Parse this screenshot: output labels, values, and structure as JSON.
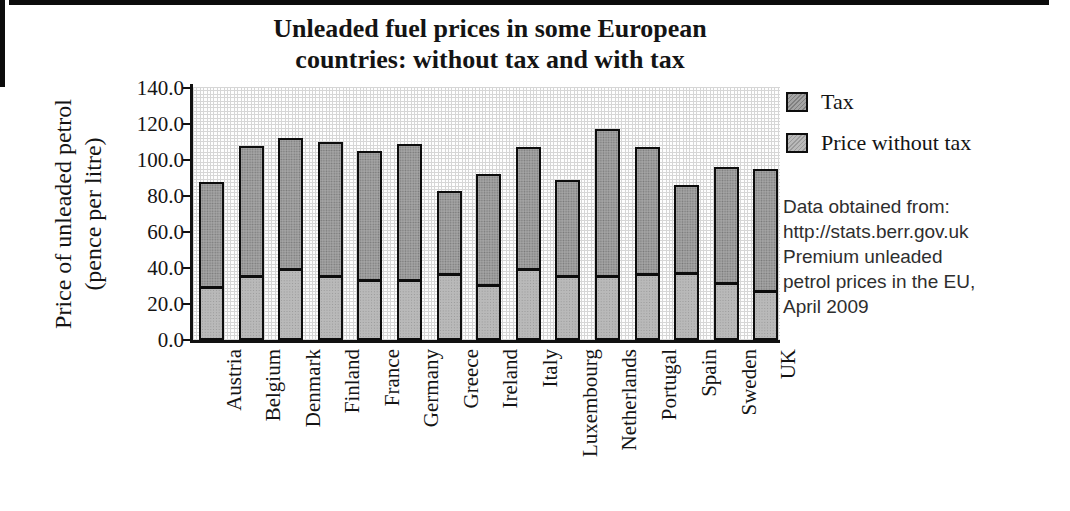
{
  "chart_data": {
    "type": "bar",
    "stacked": true,
    "title": "Unleaded fuel prices in some European countries: without tax and with tax",
    "title_lines": [
      "Unleaded fuel prices in some European",
      "countries: without tax and with tax"
    ],
    "ylabel": "Price of unleaded petrol (pence per litre)",
    "ylabel_lines": [
      "Price of unleaded petrol",
      "(pence per litre)"
    ],
    "categories": [
      "Austria",
      "Belgium",
      "Denmark",
      "Finland",
      "France",
      "Germany",
      "Greece",
      "Ireland",
      "Italy",
      "Luxembourg",
      "Netherlands",
      "Portugal",
      "Spain",
      "Sweden",
      "UK"
    ],
    "series": [
      {
        "name": "Price without tax",
        "values": [
          30,
          36,
          40,
          36,
          34,
          34,
          37,
          31,
          40,
          36,
          36,
          37,
          38,
          32,
          28
        ],
        "color": "#b9b9b9"
      },
      {
        "name": "Tax",
        "values": [
          58,
          72,
          72,
          74,
          71,
          75,
          46,
          61,
          67,
          53,
          81,
          70,
          48,
          64,
          67
        ],
        "color": "#a4a4a4"
      }
    ],
    "totals": [
      88,
      108,
      112,
      110,
      105,
      109,
      83,
      92,
      107,
      89,
      117,
      107,
      86,
      96,
      95
    ],
    "ylim": [
      0,
      140
    ],
    "ytick_step": 20,
    "yticks": [
      "0.0",
      "20.0",
      "40.0",
      "60.0",
      "80.0",
      "100.0",
      "120.0",
      "140.0"
    ],
    "grid": true,
    "legend_position": "right",
    "bar_border_color": "#0d0d0d"
  },
  "legend": {
    "items": [
      {
        "label": "Tax",
        "color": "#a4a4a4"
      },
      {
        "label": "Price without tax",
        "color": "#bababa"
      }
    ]
  },
  "source_note": {
    "lines": [
      "Data obtained from:",
      "http://stats.berr.gov.uk",
      "Premium unleaded",
      "petrol prices in the EU,",
      "April 2009"
    ]
  }
}
